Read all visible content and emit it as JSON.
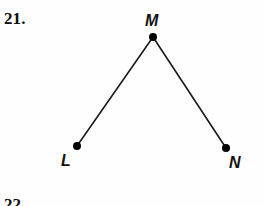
{
  "page": {
    "background_color": "#fefefe",
    "width": 264,
    "height": 206
  },
  "exercise": {
    "number_label": "21.",
    "next_number_label": "22."
  },
  "figure": {
    "type": "angle",
    "name": "angle-lmn",
    "stroke_color": "#1a1a1a",
    "stroke_width": 1.6,
    "point_color": "#000000",
    "point_radius": 4,
    "vertices": [
      {
        "id": "L",
        "label": "L",
        "x": 77,
        "y": 146
      },
      {
        "id": "M",
        "label": "M",
        "x": 153,
        "y": 37
      },
      {
        "id": "N",
        "label": "N",
        "x": 226,
        "y": 148
      }
    ],
    "segments": [
      {
        "id": "ML",
        "from": "M",
        "to": "L"
      },
      {
        "id": "MN",
        "from": "M",
        "to": "N"
      }
    ],
    "labels": {
      "m": "M",
      "l": "L",
      "n": "N"
    }
  }
}
